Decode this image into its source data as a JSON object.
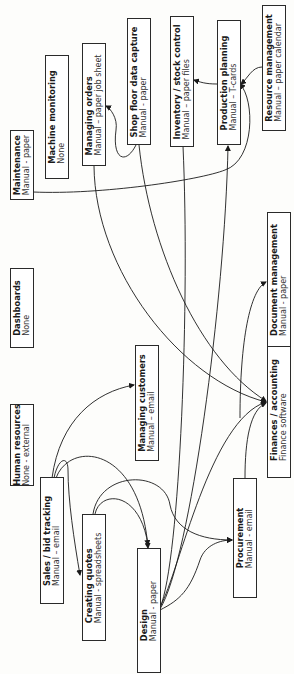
{
  "diagram": {
    "orientation": "rotated-90-ccw",
    "nodes": [
      {
        "id": "hr",
        "title": "Human resources",
        "subtitle": "None - external",
        "box": [
          10,
          404,
          24,
          82
        ]
      },
      {
        "id": "sales",
        "title": "Sales / bid tracking",
        "subtitle": "Manual – email",
        "box": [
          40,
          477,
          24,
          127
        ]
      },
      {
        "id": "quotes",
        "title": "Creating quotes",
        "subtitle": "Manual - spreadsheets",
        "box": [
          82,
          514,
          24,
          127
        ]
      },
      {
        "id": "design",
        "title": "Design",
        "subtitle": "Manual - paper",
        "box": [
          137,
          548,
          24,
          125
        ]
      },
      {
        "id": "procurement",
        "title": "Procurement",
        "subtitle": "Manual - email",
        "box": [
          233,
          478,
          24,
          120
        ]
      },
      {
        "id": "customers",
        "title": "Managing customers",
        "subtitle": "Manual – email",
        "box": [
          135,
          345,
          24,
          116
        ]
      },
      {
        "id": "finance",
        "title": "Finances / accounting",
        "subtitle": "Finance software",
        "box": [
          267,
          341,
          24,
          137
        ]
      },
      {
        "id": "docs",
        "title": "Document management",
        "subtitle": "Manual - paper",
        "box": [
          267,
          212,
          24,
          135
        ]
      },
      {
        "id": "dashboards",
        "title": "Dashboards",
        "subtitle": "None",
        "box": [
          10,
          268,
          24,
          80
        ]
      },
      {
        "id": "maintenance",
        "title": "Maintenance",
        "subtitle": "Manual - paper",
        "box": [
          10,
          130,
          24,
          70
        ]
      },
      {
        "id": "machine",
        "title": "Machine monitoring",
        "subtitle": "None",
        "box": [
          45,
          55,
          24,
          124
        ]
      },
      {
        "id": "orders",
        "title": "Managing orders",
        "subtitle": "Manual – paper job sheet",
        "box": [
          82,
          43,
          24,
          123
        ]
      },
      {
        "id": "shopfloor",
        "title": "Shop floor data capture",
        "subtitle": "Manual - paper",
        "box": [
          127,
          18,
          24,
          127
        ]
      },
      {
        "id": "inventory",
        "title": "Inventory / stock control",
        "subtitle": "Manual – paper files",
        "box": [
          170,
          16,
          24,
          131
        ]
      },
      {
        "id": "planning",
        "title": "Production planning",
        "subtitle": "Manual – T-cards",
        "box": [
          217,
          20,
          24,
          125
        ]
      },
      {
        "id": "resource",
        "title": "Resource management",
        "subtitle": "Manual – paper calendar",
        "box": [
          262,
          5,
          24,
          126
        ]
      }
    ],
    "edges": [
      {
        "from": "sales",
        "to": "customers"
      },
      {
        "from": "sales",
        "to": "quotes"
      },
      {
        "from": "sales",
        "to": "design"
      },
      {
        "from": "quotes",
        "to": "design"
      },
      {
        "from": "quotes",
        "to": "procurement"
      },
      {
        "from": "design",
        "to": "procurement"
      },
      {
        "from": "design",
        "to": "finance"
      },
      {
        "from": "design",
        "to": "inventory"
      },
      {
        "from": "design",
        "to": "planning"
      },
      {
        "from": "procurement",
        "to": "finance"
      },
      {
        "from": "orders",
        "to": "finance"
      },
      {
        "from": "shopfloor",
        "to": "orders"
      },
      {
        "from": "shopfloor",
        "to": "finance"
      },
      {
        "from": "maintenance",
        "to": "planning"
      },
      {
        "from": "planning",
        "to": "inventory"
      },
      {
        "from": "resource",
        "to": "planning"
      },
      {
        "from": "finance",
        "to": "docs"
      }
    ],
    "colors": {
      "line": "#1a1a1a",
      "box_border": "#2a2a2a",
      "background": "#fdfdfb"
    }
  }
}
